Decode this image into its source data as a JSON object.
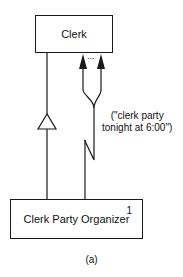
{
  "diagram": {
    "caption": "(a)",
    "nodes": [
      {
        "id": "clerk",
        "label": "Clerk",
        "multiplicity": ""
      },
      {
        "id": "clerk-party-organizer",
        "label": "Clerk Party Organizer",
        "multiplicity": "1"
      }
    ],
    "edges": [
      {
        "from": "clerk-party-organizer",
        "to": "clerk",
        "type": "inheritance",
        "head": "hollow-triangle"
      },
      {
        "from": "clerk-party-organizer",
        "to": "clerk",
        "type": "multicast-message",
        "head": "filled-arrows",
        "fanout_ellipsis": "...",
        "label": "(\"clerk party tonight at 6:00\")"
      }
    ],
    "message": {
      "line1": "(\"clerk party",
      "line2": "tonight at 6:00\")"
    },
    "ellipsis": "..."
  }
}
